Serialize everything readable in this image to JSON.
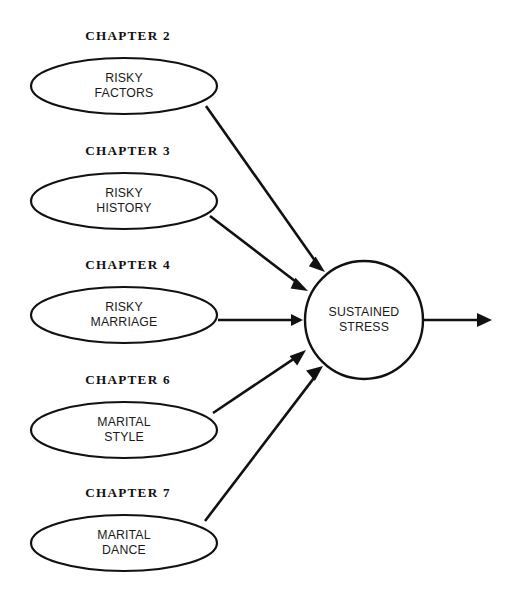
{
  "diagram": {
    "type": "flow-diagram",
    "background_color": "#ffffff",
    "stroke_color": "#111111",
    "fill_color": "#ffffff",
    "sources": [
      {
        "id": "risky-factors",
        "chapter": "CHAPTER 2",
        "line1": "RISKY",
        "line2": "FACTORS",
        "cx": 124,
        "cy": 86,
        "rx": 93,
        "ry": 28,
        "chapter_y": 40
      },
      {
        "id": "risky-history",
        "chapter": "CHAPTER 3",
        "line1": "RISKY",
        "line2": "HISTORY",
        "cx": 124,
        "cy": 201,
        "rx": 93,
        "ry": 28,
        "chapter_y": 155
      },
      {
        "id": "risky-marriage",
        "chapter": "CHAPTER 4",
        "line1": "RISKY",
        "line2": "MARRIAGE",
        "cx": 124,
        "cy": 315,
        "rx": 93,
        "ry": 28,
        "chapter_y": 269
      },
      {
        "id": "marital-style",
        "chapter": "CHAPTER 6",
        "line1": "MARITAL",
        "line2": "STYLE",
        "cx": 124,
        "cy": 430,
        "rx": 93,
        "ry": 28,
        "chapter_y": 384
      },
      {
        "id": "marital-dance",
        "chapter": "CHAPTER 7",
        "line1": "MARITAL",
        "line2": "DANCE",
        "cx": 124,
        "cy": 543,
        "rx": 93,
        "ry": 28,
        "chapter_y": 497
      }
    ],
    "hub": {
      "id": "sustained-stress",
      "line1": "SUSTAINED",
      "line2": "STRESS",
      "cx": 364,
      "cy": 320,
      "r": 59
    },
    "edges": [
      {
        "id": "edge-factors-to-stress",
        "from": "risky-factors",
        "to": "sustained-stress",
        "x1": 206,
        "y1": 106,
        "x2": 325,
        "y2": 272
      },
      {
        "id": "edge-history-to-stress",
        "from": "risky-history",
        "to": "sustained-stress",
        "x1": 210,
        "y1": 216,
        "x2": 308,
        "y2": 291
      },
      {
        "id": "edge-marriage-to-stress",
        "from": "risky-marriage",
        "to": "sustained-stress",
        "x1": 218,
        "y1": 320,
        "x2": 303,
        "y2": 320
      },
      {
        "id": "edge-style-to-stress",
        "from": "marital-style",
        "to": "sustained-stress",
        "x1": 213,
        "y1": 413,
        "x2": 306,
        "y2": 350
      },
      {
        "id": "edge-dance-to-stress",
        "from": "marital-dance",
        "to": "sustained-stress",
        "x1": 205,
        "y1": 521,
        "x2": 323,
        "y2": 366
      }
    ],
    "output_edge": {
      "id": "edge-stress-output",
      "from": "sustained-stress",
      "x1": 423,
      "y1": 320,
      "x2": 492,
      "y2": 320
    }
  }
}
